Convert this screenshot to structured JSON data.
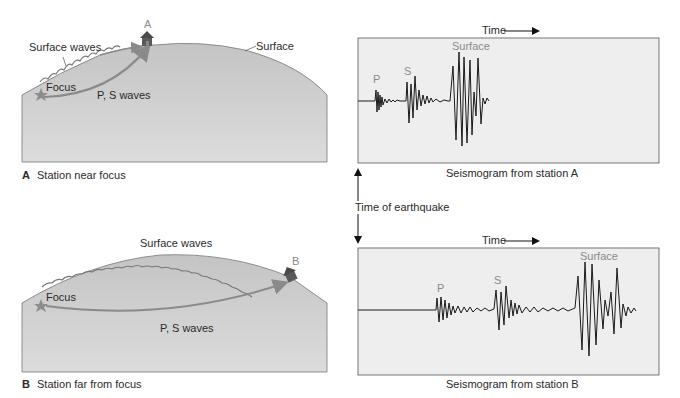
{
  "panelA": {
    "letter": "A",
    "caption": "Station near focus",
    "station_label": "A",
    "surface_waves": "Surface waves",
    "surface": "Surface",
    "focus": "Focus",
    "ps_waves": "P, S waves"
  },
  "panelB": {
    "letter": "B",
    "caption": "Station far from focus",
    "station_label": "B",
    "surface_waves": "Surface waves",
    "focus": "Focus",
    "ps_waves": "P, S waves"
  },
  "seismogramA": {
    "time_label": "Time",
    "p": "P",
    "s": "S",
    "surface": "Surface",
    "caption": "Seismogram from station A"
  },
  "seismogramB": {
    "time_label": "Time",
    "p": "P",
    "s": "S",
    "surface": "Surface",
    "caption": "Seismogram from station B"
  },
  "time_of_earthquake": "Time of earthquake",
  "colors": {
    "ground": "#c9c9c9",
    "arrow": "#8a8a8a",
    "star": "#8d8d8d",
    "house": "#5a5a5a",
    "panel_bg": "#eeeeee",
    "trace": "#1a1a1a"
  }
}
